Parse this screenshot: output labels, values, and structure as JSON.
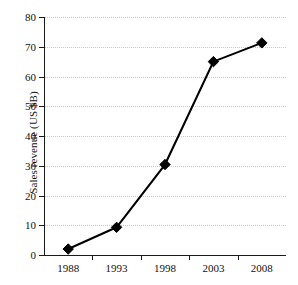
{
  "chart_data": {
    "type": "line",
    "title": "",
    "subtitle": "",
    "xlabel": "",
    "ylabel": "Sales revenue (US $B)",
    "categories": [
      "1988",
      "1993",
      "1998",
      "2003",
      "2008"
    ],
    "values": [
      2.0,
      9.3,
      30.4,
      65.0,
      71.3
    ],
    "series": [
      {
        "name": "Sales revenue",
        "values": [
          2.0,
          9.3,
          30.4,
          65.0,
          71.3
        ],
        "color": "#000000",
        "marker": "diamond",
        "line_style": "solid"
      }
    ],
    "ylim": [
      0,
      80
    ],
    "y_ticks": [
      0,
      10,
      20,
      30,
      40,
      50,
      60,
      70,
      80
    ],
    "y_tick_labels": [
      "0",
      "10",
      "20",
      "30",
      "40",
      "50",
      "60",
      "70",
      "80"
    ],
    "x_tick_labels": [
      "1988",
      "1993",
      "1998",
      "2003",
      "2008"
    ],
    "grid": {
      "horizontal": true,
      "vertical": false,
      "style": "dotted",
      "color": "#c9c9c9"
    },
    "legend": {
      "visible": false,
      "position": "none",
      "entries": []
    },
    "annotations": [],
    "background_color": "#ffffff",
    "axis_color": "#1a1a1a"
  }
}
